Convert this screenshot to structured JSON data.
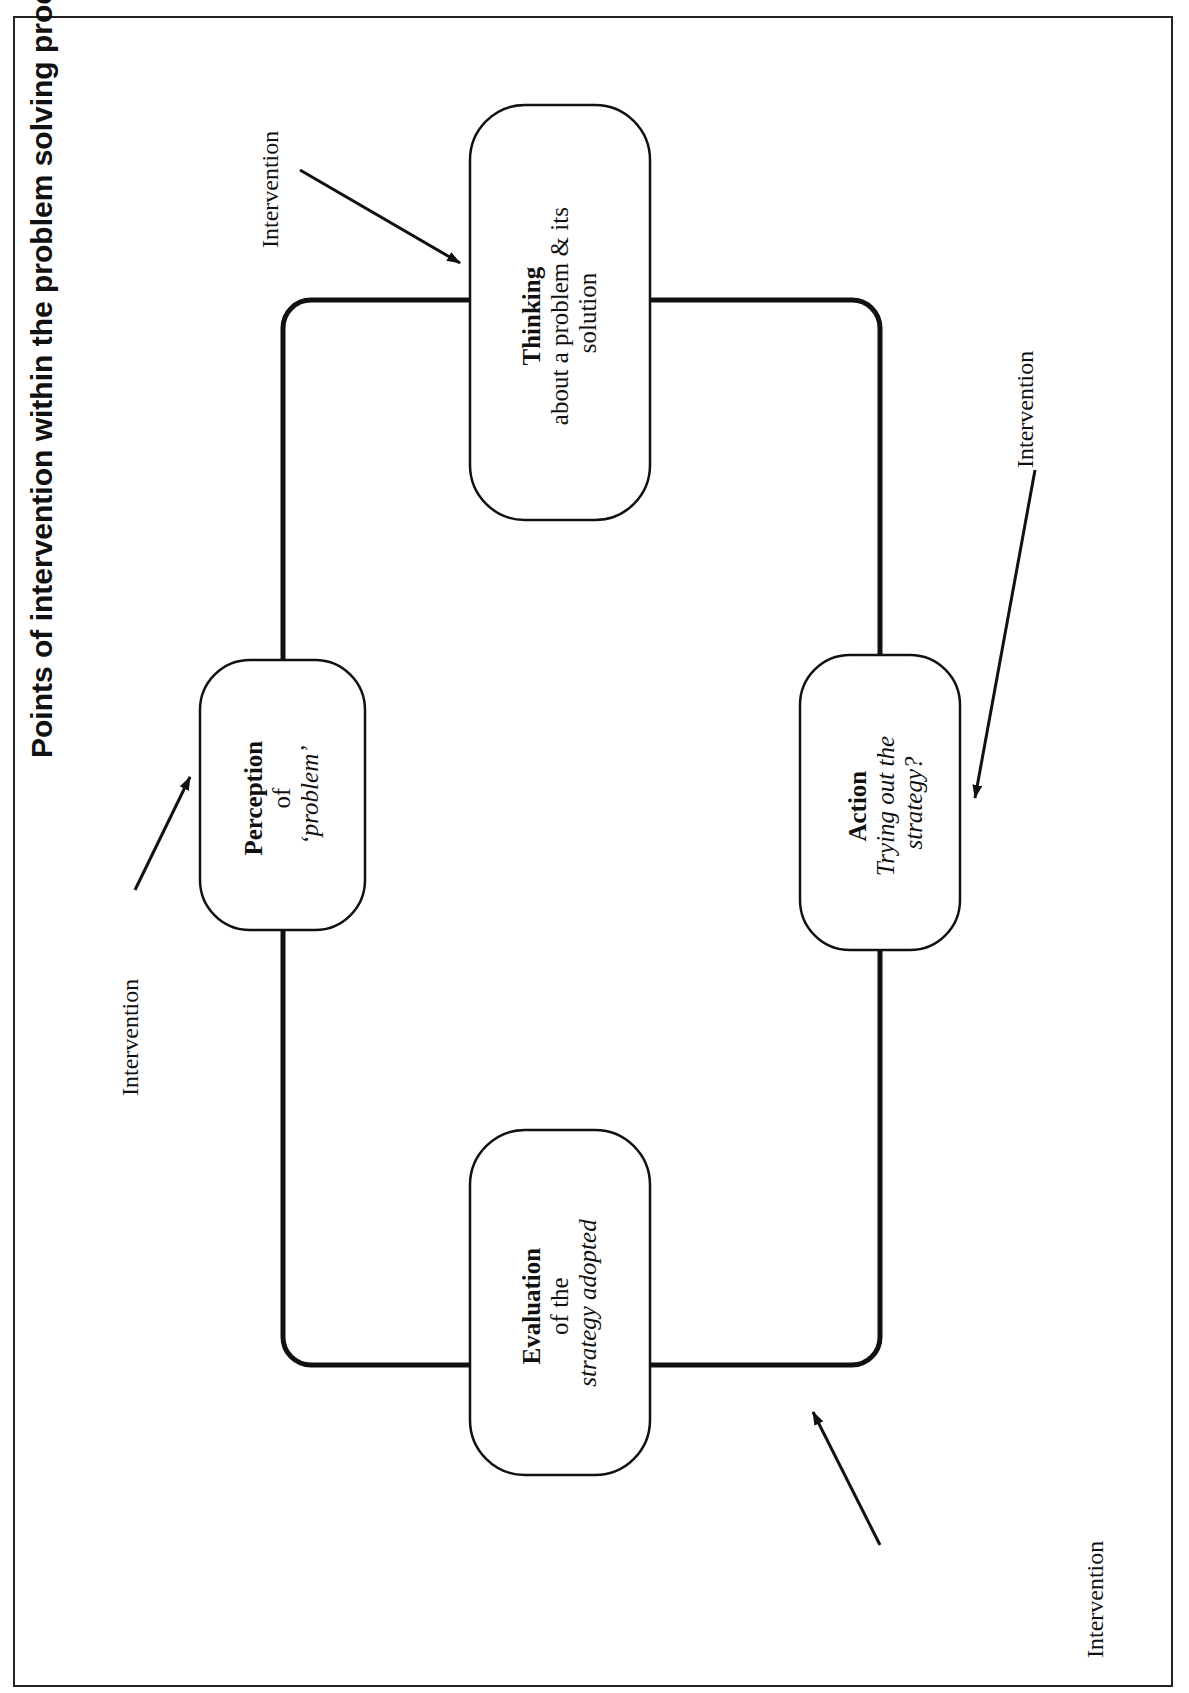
{
  "title": "Points of intervention within the problem solving process",
  "boxes": {
    "thinking": {
      "heading": "Thinking",
      "line1": "about a problem & its",
      "line2": "solution"
    },
    "perception": {
      "heading": "Perception",
      "line1": "of",
      "line2": "‘problem’"
    },
    "action": {
      "heading": "Action",
      "line1": "Trying out the",
      "line2": "strategy?"
    },
    "evaluation": {
      "heading": "Evaluation",
      "line1": "of the",
      "line2": "strategy adopted"
    }
  },
  "interventions": [
    {
      "label": "Intervention",
      "target": "thinking"
    },
    {
      "label": "Intervention",
      "target": "perception"
    },
    {
      "label": "Intervention",
      "target": "action"
    },
    {
      "label": "Intervention",
      "target": "evaluation"
    }
  ],
  "colors": {
    "ink": "#111111",
    "background": "#ffffff"
  }
}
